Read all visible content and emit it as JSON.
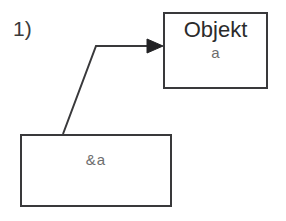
{
  "figure": {
    "step_label": "1)",
    "background_color": "#ffffff",
    "line_color": "#39393b"
  },
  "object_box": {
    "title": "Objekt",
    "subtitle": "a",
    "title_color": "#2b2b2b",
    "subtitle_color": "#6d6d6d"
  },
  "pointer_box": {
    "label": "&a",
    "label_color": "#6d6d6d"
  },
  "arrow": {
    "name": "pointer-reference-arrow",
    "from": "pointer_box",
    "to": "object_box",
    "points": "63,134 96,46 158,46",
    "head_color": "#222224",
    "stroke_color": "#39393b"
  }
}
